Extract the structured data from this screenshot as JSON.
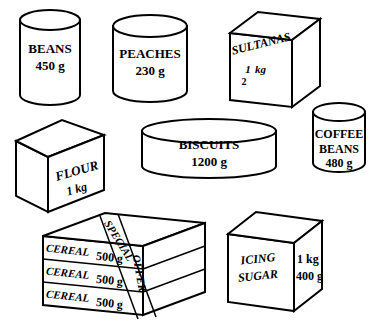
{
  "figure": {
    "background_color": "#ffffff",
    "line_color": "#000000",
    "width": 378,
    "height": 322
  },
  "items": [
    {
      "id": "beans",
      "shape": "cylinder",
      "name_label": "BEANS",
      "weight_label": "450 g",
      "weight_value": 450,
      "weight_unit": "g"
    },
    {
      "id": "peaches",
      "shape": "cylinder",
      "name_label": "PEACHES",
      "weight_label": "230 g",
      "weight_value": 230,
      "weight_unit": "g"
    },
    {
      "id": "sultanas",
      "shape": "box",
      "name_label": "SULTANAS",
      "weight_label": "1 kg",
      "weight_fraction_numerator": "1",
      "weight_fraction_denominator": "2",
      "weight_unit_label": "kg",
      "weight_value": 0.5,
      "weight_unit": "kg"
    },
    {
      "id": "flour",
      "shape": "box",
      "name_label": "FLOUR",
      "weight_label": "1 kg",
      "weight_value": 1,
      "weight_unit": "kg"
    },
    {
      "id": "biscuits",
      "shape": "flat-cylinder",
      "name_label": "BISCUITS",
      "weight_label": "1200 g",
      "weight_value": 1200,
      "weight_unit": "g"
    },
    {
      "id": "coffee-beans",
      "shape": "cylinder",
      "name_label_line1": "COFFEE",
      "name_label_line2": "BEANS",
      "weight_label": "480 g",
      "weight_value": 480,
      "weight_unit": "g"
    },
    {
      "id": "cereal-stack",
      "shape": "stacked-boxes",
      "count": 3,
      "banner_line1": "SPECIAL",
      "banner_line2": "OFFER",
      "boxes": [
        {
          "name_label": "CEREAL",
          "weight_label": "500 g",
          "weight_value": 500,
          "weight_unit": "g"
        },
        {
          "name_label": "CEREAL",
          "weight_label": "500 g",
          "weight_value": 500,
          "weight_unit": "g"
        },
        {
          "name_label": "CEREAL",
          "weight_label": "500 g",
          "weight_value": 500,
          "weight_unit": "g"
        }
      ]
    },
    {
      "id": "icing-sugar",
      "shape": "box",
      "name_label_line1": "ICING",
      "name_label_line2": "SUGAR",
      "side_weight_line1": "1 kg",
      "side_weight_line2": "400 g",
      "weight_value": 1.4,
      "weight_unit": "kg"
    }
  ]
}
